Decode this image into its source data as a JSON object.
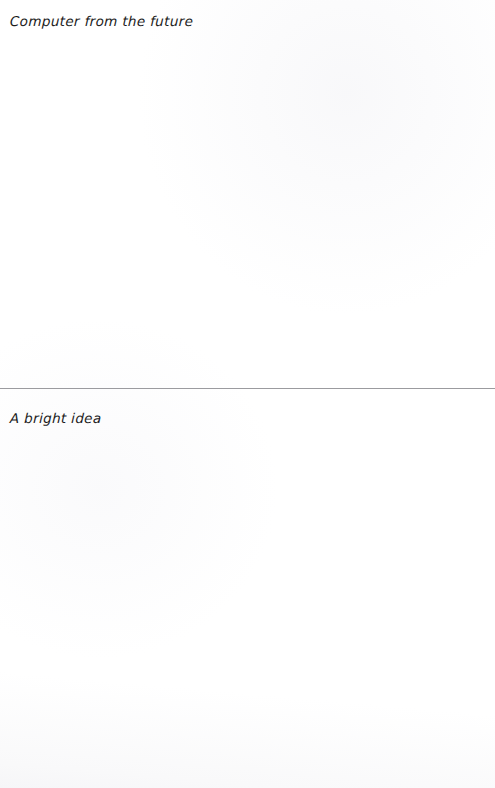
{
  "page": {
    "background_color": "#ffffff",
    "width": 495,
    "height": 788
  },
  "sections": [
    {
      "id": "section-top",
      "heading": "Computer from the future",
      "body_text": ""
    },
    {
      "id": "section-bottom",
      "heading": "A bright idea",
      "body_text": ""
    }
  ],
  "divider": {
    "color": "#9b9b9f",
    "thickness_px": 1
  },
  "text_style": {
    "color": "#1b1b1b"
  }
}
